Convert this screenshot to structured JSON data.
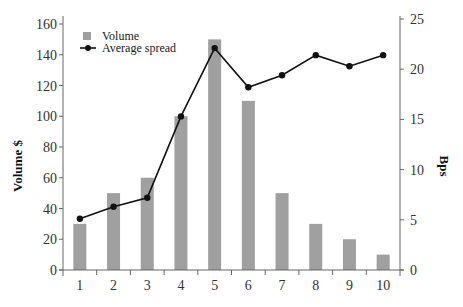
{
  "chart_data": {
    "type": "bar+line",
    "title": "",
    "categories": [
      "1",
      "2",
      "3",
      "4",
      "5",
      "6",
      "7",
      "8",
      "9",
      "10"
    ],
    "series": [
      {
        "name": "Volume",
        "type": "bar",
        "axis": "left",
        "values": [
          30,
          50,
          60,
          100,
          150,
          110,
          50,
          30,
          20,
          10
        ]
      },
      {
        "name": "Average spread",
        "type": "line",
        "axis": "right",
        "values": [
          5.1,
          6.3,
          7.2,
          15.3,
          22.1,
          18.2,
          19.4,
          21.4,
          20.3,
          21.4
        ]
      }
    ],
    "xlabel": "",
    "ylabel_left": "Volume $",
    "ylabel_right": "Bps",
    "ylim_left": [
      0,
      160
    ],
    "ylim_right": [
      0,
      25
    ],
    "yticks_left": [
      0,
      20,
      40,
      60,
      80,
      100,
      120,
      140,
      160
    ],
    "yticks_right": [
      0,
      5,
      10,
      15,
      20,
      25
    ],
    "grid": false,
    "legend_position": "upper left"
  },
  "colors": {
    "bar": "#a0a0a0",
    "line": "#111111",
    "axis": "#666666"
  },
  "legend": {
    "volume_label": "Volume",
    "spread_label": "Average spread"
  },
  "axes": {
    "left_title": "Volume $",
    "right_title": "Bps"
  }
}
